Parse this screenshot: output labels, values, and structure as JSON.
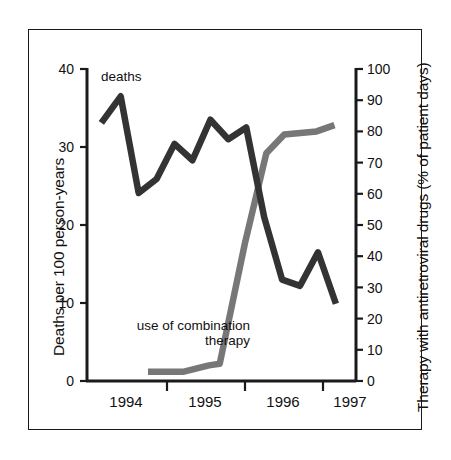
{
  "chart_data": {
    "type": "line",
    "title": "",
    "xlabel": "",
    "ylabel": "Deaths per 100 person-years",
    "y2label": "Therapy with antiretroviral drugs (% of patient days)",
    "grid": false,
    "legend": "inline-annotations",
    "xlim": [
      1993.75,
      1997.5
    ],
    "ylim": [
      0,
      40
    ],
    "y2lim": [
      0,
      100
    ],
    "xticks": [
      1994.5,
      1995.5,
      1996.5
    ],
    "xticklabels": [
      "",
      "",
      ""
    ],
    "year_labels": [
      "1994",
      "1995",
      "1996",
      "1997"
    ],
    "year_label_positions": [
      1994.1,
      1995.1,
      1996.1,
      1996.95
    ],
    "yticks_left": [
      0,
      10,
      20,
      30,
      40
    ],
    "yticks_right": [
      0,
      10,
      20,
      30,
      40,
      50,
      60,
      70,
      80,
      90,
      100
    ],
    "series": [
      {
        "name": "deaths",
        "axis": "left",
        "color": "#333333",
        "annotation": "deaths",
        "x": [
          1993.95,
          1994.22,
          1994.47,
          1994.72,
          1994.97,
          1995.22,
          1995.47,
          1995.72,
          1995.97,
          1996.22,
          1996.47,
          1996.72,
          1996.97,
          1997.22
        ],
        "values": [
          33.1,
          36.5,
          24.1,
          25.9,
          30.4,
          28.3,
          33.5,
          31.0,
          32.5,
          21.0,
          13.0,
          12.2,
          16.5,
          9.9
        ]
      },
      {
        "name": "use of combination therapy",
        "axis": "right",
        "color": "#777777",
        "annotation": "use of combination therapy",
        "x": [
          1994.6,
          1995.1,
          1995.45,
          1995.6,
          1995.95,
          1996.25,
          1996.5,
          1996.95,
          1997.2
        ],
        "values": [
          3.0,
          3.0,
          5.0,
          5.5,
          44.0,
          73.0,
          79.0,
          80.0,
          82.0
        ]
      }
    ]
  },
  "axes": {
    "left": {
      "title": "Deaths per 100 person-years",
      "ticks": [
        "40",
        "30",
        "20",
        "10",
        "0"
      ]
    },
    "right": {
      "title": "Therapy with antiretroviral drugs (% of patient days)",
      "ticks": [
        "100",
        "90",
        "80",
        "70",
        "60",
        "50",
        "40",
        "30",
        "20",
        "10",
        "0"
      ]
    },
    "x": {
      "labels": [
        "1994",
        "1995",
        "1996",
        "1997"
      ]
    }
  },
  "annotations": {
    "deaths": "deaths",
    "therapy": "use of combination therapy"
  },
  "colors": {
    "deaths_line": "#333333",
    "therapy_line": "#777777",
    "axis": "#1a1a1a",
    "frame": "#1a1a1a",
    "background": "#ffffff"
  }
}
